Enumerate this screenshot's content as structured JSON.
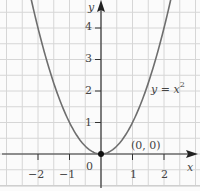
{
  "chart_data": {
    "type": "line",
    "title": "",
    "xlabel": "x",
    "ylabel": "y",
    "xlim": [
      -3.0,
      3.0
    ],
    "ylim": [
      -1.0,
      4.9
    ],
    "grid": true,
    "grid_step": 0.5,
    "x_ticks": [
      -2,
      -1,
      0,
      1,
      2
    ],
    "x_tick_labels": [
      "−2",
      "−1",
      "0",
      "1",
      "2"
    ],
    "y_ticks": [
      1,
      2,
      3,
      4
    ],
    "y_tick_labels": [
      "1",
      "2",
      "3",
      "4"
    ],
    "series": [
      {
        "name": "y = x^2",
        "function": "x^2",
        "x": [
          -2.2,
          -2,
          -1.5,
          -1,
          -0.5,
          0,
          0.5,
          1,
          1.5,
          2,
          2.2
        ],
        "values": [
          4.84,
          4,
          2.25,
          1,
          0.25,
          0,
          0.25,
          1,
          2.25,
          4,
          4.84
        ],
        "color": "#6e6e6e"
      }
    ],
    "annotations": [
      {
        "text": "y = x²",
        "x": 1.65,
        "y": 1.9
      },
      {
        "text": "(0, 0)",
        "x": 1.2,
        "y": 0.25,
        "point": [
          0,
          0
        ]
      }
    ]
  },
  "labels": {
    "x_axis": "x",
    "y_axis": "y",
    "curve_label_base": "y = x",
    "curve_label_exp": "2",
    "point_label": "(0, 0)",
    "origin": "0",
    "xt_m2": "−2",
    "xt_m1": "−1",
    "xt_1": "1",
    "xt_2": "2",
    "yt_1": "1",
    "yt_2": "2",
    "yt_3": "3",
    "yt_4": "4"
  }
}
